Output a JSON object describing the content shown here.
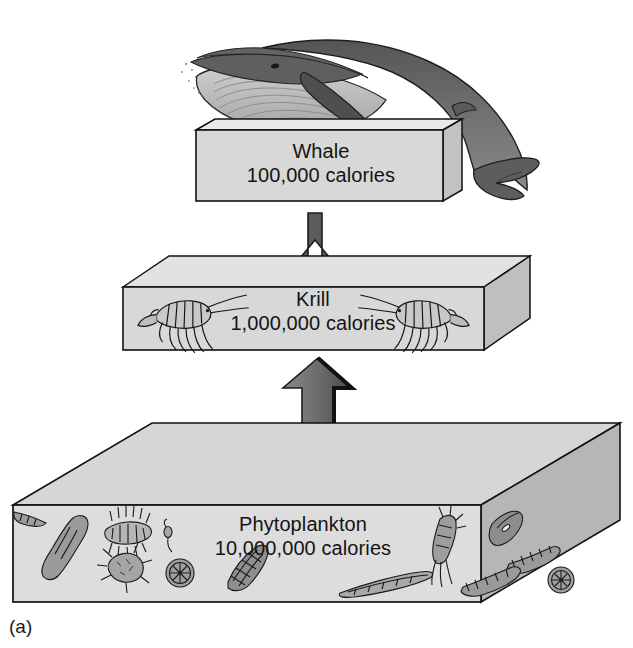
{
  "figure": {
    "panel_label": "(a)",
    "kind": "energy-pyramid-food-chain-diagram",
    "background": "#ffffff"
  },
  "levels": [
    {
      "id": "whale",
      "name": "Whale",
      "calories": "100,000 calories",
      "illustration": "whale-illustration",
      "box_fill": "#d7d7d7",
      "box_top_fill": "#e6e6e6",
      "box_side_fill": "#c0c0c0"
    },
    {
      "id": "krill",
      "name": "Krill",
      "calories": "1,000,000 calories",
      "illustration": "krill-illustration",
      "box_fill": "#d7d7d7",
      "box_top_fill": "#e0e0e0",
      "box_side_fill": "#bdbdbd"
    },
    {
      "id": "phytoplankton",
      "name": "Phytoplankton",
      "calories": "10,000,000 calories",
      "illustration": "phytoplankton-illustration",
      "box_fill": "#dcdcdc",
      "box_top_fill": "#d4d4d4",
      "box_side_fill": "#b4b4b4"
    }
  ],
  "arrows": [
    {
      "id": "arrow-krill-to-whale",
      "from": "krill",
      "to": "whale",
      "fill": "#5a5a5a"
    },
    {
      "id": "arrow-phytoplankton-to-krill",
      "from": "phytoplankton",
      "to": "krill",
      "fill": "#6e6e6e"
    }
  ],
  "colors": {
    "outline": "#111111",
    "whale_body": "#6b6b6b",
    "whale_belly": "#b9b9b9",
    "plankton_ink": "#1a1a1a",
    "text": "#141414"
  }
}
